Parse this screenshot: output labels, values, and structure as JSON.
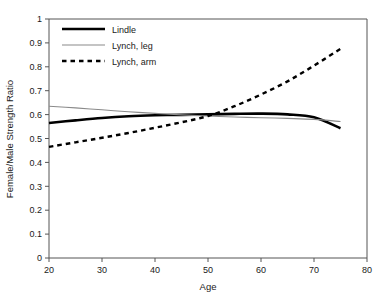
{
  "chart_data": {
    "type": "line",
    "title": "",
    "xlabel": "Age",
    "ylabel": "Female/Male Strength Ratio",
    "xlim": [
      20,
      80
    ],
    "ylim": [
      0,
      1
    ],
    "xticks": [
      "20",
      "30",
      "40",
      "50",
      "60",
      "70",
      "80"
    ],
    "yticks": [
      "0",
      "0.1",
      "0.2",
      "0.3",
      "0.4",
      "0.5",
      "0.6",
      "0.7",
      "0.8",
      "0.9",
      "1"
    ],
    "grid": false,
    "legend_position": "top-left",
    "series": [
      {
        "name": "Lindle",
        "style": "solid",
        "color": "#000000",
        "width": 2.6,
        "x": [
          20,
          25,
          30,
          35,
          40,
          45,
          50,
          55,
          60,
          65,
          70,
          75
        ],
        "values": [
          0.565,
          0.576,
          0.586,
          0.593,
          0.597,
          0.599,
          0.601,
          0.603,
          0.604,
          0.601,
          0.589,
          0.543
        ]
      },
      {
        "name": "Lynch, leg",
        "style": "solid",
        "color": "#8a8a8a",
        "width": 1.1,
        "x": [
          20,
          25,
          30,
          35,
          40,
          45,
          50,
          55,
          60,
          65,
          70,
          75
        ],
        "values": [
          0.635,
          0.628,
          0.62,
          0.612,
          0.605,
          0.599,
          0.594,
          0.59,
          0.587,
          0.584,
          0.58,
          0.571
        ]
      },
      {
        "name": "Lynch, arm",
        "style": "dashed",
        "color": "#000000",
        "width": 2.4,
        "x": [
          20,
          25,
          30,
          35,
          40,
          45,
          50,
          55,
          60,
          65,
          70,
          75
        ],
        "values": [
          0.465,
          0.484,
          0.503,
          0.523,
          0.545,
          0.568,
          0.594,
          0.635,
          0.684,
          0.739,
          0.805,
          0.875
        ]
      }
    ]
  },
  "legend": {
    "entries": [
      {
        "label": "Lindle"
      },
      {
        "label": "Lynch, leg"
      },
      {
        "label": "Lynch, arm"
      }
    ]
  }
}
